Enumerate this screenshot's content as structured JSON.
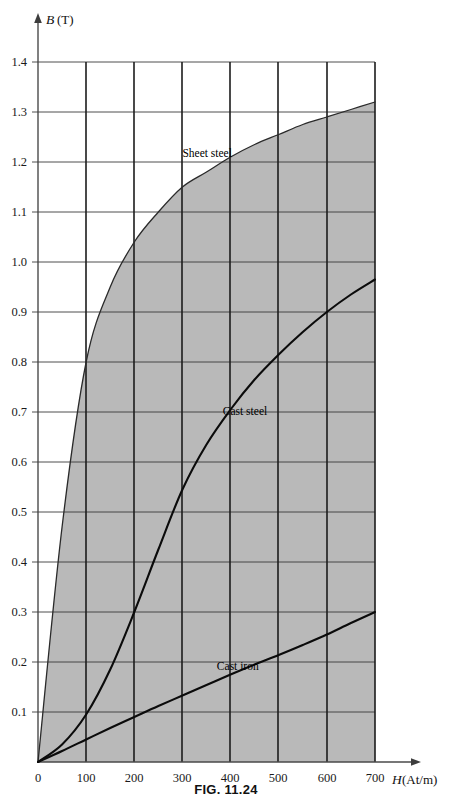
{
  "figure": {
    "caption": "FIG. 11.24"
  },
  "axes": {
    "y_title_symbol": "B",
    "y_title_unit": "(T)",
    "x_title_symbol": "H",
    "x_title_unit": "(At/m)",
    "origin_label": "0",
    "y_ticks": [
      "1.4",
      "1.3",
      "1.2",
      "1.1",
      "1.0",
      "0.9",
      "0.8",
      "0.7",
      "0.6",
      "0.5",
      "0.4",
      "0.3",
      "0.2",
      "0.1"
    ],
    "x_ticks": [
      "0",
      "100",
      "200",
      "300",
      "400",
      "500",
      "600",
      "700"
    ]
  },
  "labels": {
    "sheet_steel": "Sheet steel",
    "cast_steel": "Cast steel",
    "cast_iron": "Cast iron"
  },
  "colors": {
    "shade": "#b9b9b9",
    "grid_major": "#1c1c1c",
    "grid_minor": "#3a3a3a",
    "curve": "#0b0b0b",
    "background": "#ffffff"
  },
  "chart_data": {
    "type": "line",
    "title": "FIG. 11.24",
    "xlabel": "H (At/m)",
    "ylabel": "B (T)",
    "xlim": [
      0,
      700
    ],
    "ylim": [
      0,
      1.4
    ],
    "grid": true,
    "legend": "inline-annotations",
    "x": [
      0,
      50,
      100,
      150,
      200,
      250,
      300,
      350,
      400,
      450,
      500,
      550,
      600,
      650,
      700
    ],
    "series": [
      {
        "name": "Sheet steel",
        "label_position": {
          "x": 300,
          "y": 1.21
        },
        "values": [
          0.0,
          0.47,
          0.8,
          0.95,
          1.04,
          1.1,
          1.15,
          1.18,
          1.21,
          1.235,
          1.255,
          1.275,
          1.29,
          1.305,
          1.32
        ]
      },
      {
        "name": "Cast steel",
        "label_position": {
          "x": 430,
          "y": 0.695
        },
        "values": [
          0.0,
          0.035,
          0.095,
          0.185,
          0.3,
          0.425,
          0.545,
          0.635,
          0.705,
          0.765,
          0.815,
          0.86,
          0.9,
          0.935,
          0.965
        ]
      },
      {
        "name": "Cast iron",
        "label_position": {
          "x": 415,
          "y": 0.185
        },
        "values": [
          0.0,
          0.022,
          0.045,
          0.068,
          0.09,
          0.112,
          0.133,
          0.154,
          0.175,
          0.195,
          0.214,
          0.234,
          0.255,
          0.278,
          0.3
        ]
      }
    ]
  }
}
